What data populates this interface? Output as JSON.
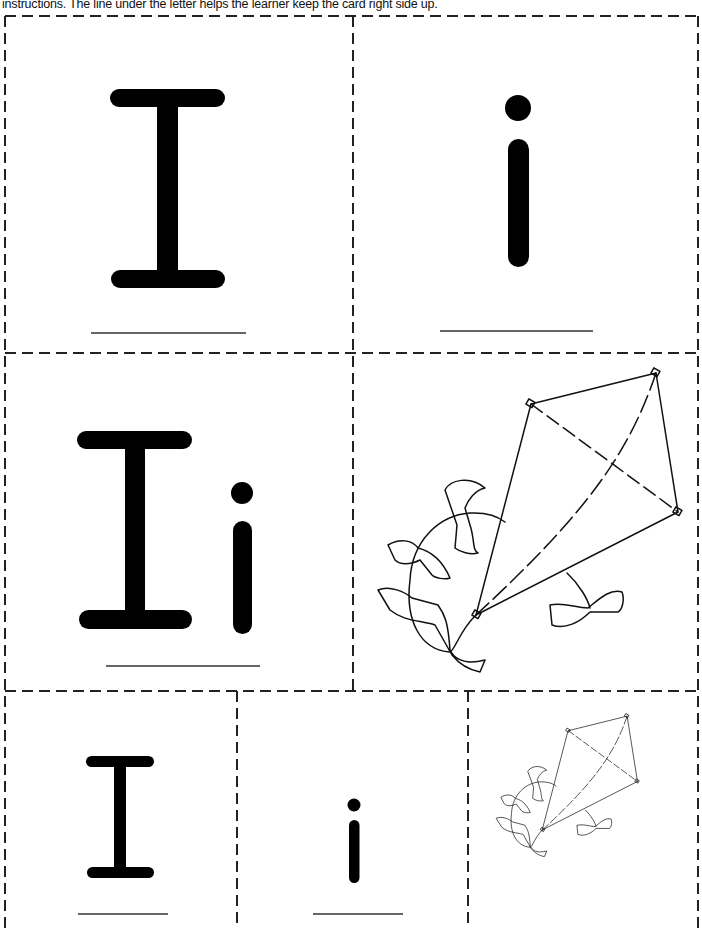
{
  "instructions": "instructions.  The line under the letter helps the learner keep the card right side up.",
  "cards": [
    {
      "id": "card-uppercase-large",
      "letter": "I",
      "case": "uppercase",
      "size": "large"
    },
    {
      "id": "card-lowercase-large",
      "letter": "i",
      "case": "lowercase",
      "size": "large"
    },
    {
      "id": "card-combo-large",
      "letters": "Ii",
      "size": "large"
    },
    {
      "id": "card-kite-large",
      "picture": "kite",
      "size": "large"
    },
    {
      "id": "card-uppercase-small",
      "letter": "I",
      "case": "uppercase",
      "size": "small"
    },
    {
      "id": "card-lowercase-small",
      "letter": "i",
      "case": "lowercase",
      "size": "small"
    },
    {
      "id": "card-kite-small",
      "picture": "kite",
      "size": "small"
    }
  ],
  "colors": {
    "ink": "#000000",
    "cut_line": "#222222",
    "guide_line": "#333333",
    "paper": "#ffffff"
  }
}
